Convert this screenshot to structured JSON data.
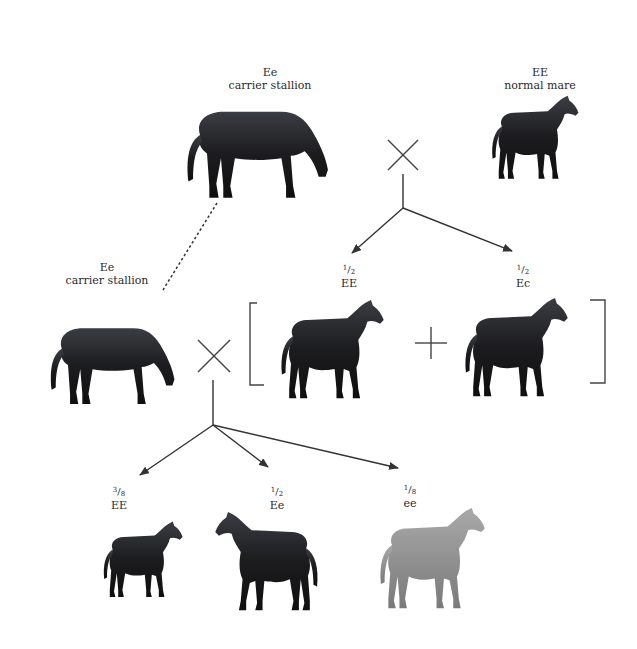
{
  "diagram": {
    "type": "genetic-cross-pedigree",
    "colors": {
      "dark_horse": "#1c1c1e",
      "highlight": "#5a5e66",
      "gray_horse": "#8a8a8a",
      "line": "#333333"
    },
    "parents_gen1": {
      "stallion": {
        "genotype": "Ee",
        "description": "carrier stallion",
        "coat": "dark"
      },
      "mare": {
        "genotype": "EE",
        "description": "normal mare",
        "coat": "dark"
      },
      "cross_symbol": "×"
    },
    "offspring_gen1": [
      {
        "fraction_num": "1",
        "fraction_den": "2",
        "genotype": "EE",
        "coat": "dark"
      },
      {
        "fraction_num": "1",
        "fraction_den": "2",
        "genotype": "Ec",
        "coat": "dark"
      }
    ],
    "plus_symbol": "+",
    "parents_gen2": {
      "stallion": {
        "genotype": "Ee",
        "description": "carrier stallion",
        "coat": "dark"
      },
      "cross_symbol": "×"
    },
    "offspring_gen2": [
      {
        "fraction_num": "3",
        "fraction_den": "8",
        "genotype": "EE",
        "coat": "dark"
      },
      {
        "fraction_num": "1",
        "fraction_den": "2",
        "genotype": "Ee",
        "coat": "dark"
      },
      {
        "fraction_num": "1",
        "fraction_den": "8",
        "genotype": "ee",
        "coat": "gray"
      }
    ]
  }
}
